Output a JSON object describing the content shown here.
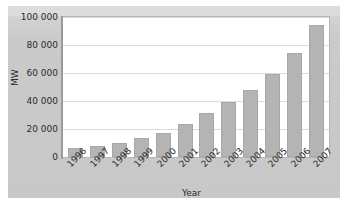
{
  "chart_data": {
    "type": "bar",
    "title": "",
    "xlabel": "Year",
    "ylabel": "MW",
    "categories": [
      "1996",
      "1997",
      "1998",
      "1999",
      "2000",
      "2001",
      "2002",
      "2003",
      "2004",
      "2005",
      "2006",
      "2007"
    ],
    "values": [
      6100,
      7600,
      10200,
      13600,
      17400,
      23900,
      31100,
      39400,
      47600,
      59100,
      74100,
      94100
    ],
    "ylim": [
      0,
      100000
    ],
    "ytick_labels": [
      "0",
      "20 000",
      "40 000",
      "60 000",
      "80 000",
      "100 000"
    ],
    "ytick_values": [
      0,
      20000,
      40000,
      60000,
      80000,
      100000
    ],
    "grid": true,
    "legend": "none",
    "colors": {
      "bar_fill": "#b4b4b4",
      "bar_border": "#a8a8a8",
      "plot_background": "#ffffff",
      "panel_background": "#cdcdcd",
      "gridline": "#dcdcdc",
      "axis": "#9a9a9a",
      "text": "#2b2b2b"
    }
  }
}
